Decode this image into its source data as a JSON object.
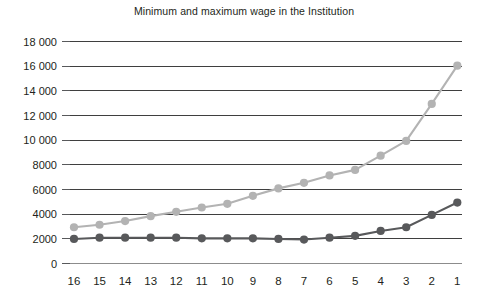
{
  "chart_data": {
    "type": "line",
    "title": "Minimum and maximum wage in the Institution",
    "xlabel": "",
    "ylabel": "",
    "categories": [
      "16",
      "15",
      "14",
      "13",
      "12",
      "11",
      "10",
      "9",
      "8",
      "7",
      "6",
      "5",
      "4",
      "3",
      "2",
      "1"
    ],
    "ylim": [
      0,
      18000
    ],
    "yticks": [
      0,
      2000,
      4000,
      6000,
      8000,
      10000,
      12000,
      14000,
      16000,
      18000
    ],
    "ytick_labels": [
      "0",
      "2000",
      "4000",
      "6000",
      "8000",
      "10 000",
      "12 000",
      "14 000",
      "16 000",
      "18 000"
    ],
    "grid": true,
    "legend": "none",
    "series": [
      {
        "name": "maximum wage",
        "color": "#b3b3b3",
        "marker": "circle",
        "values": [
          2900,
          3100,
          3400,
          3800,
          4150,
          4500,
          4800,
          5450,
          6050,
          6500,
          7100,
          7550,
          8700,
          9900,
          12900,
          16000
        ]
      },
      {
        "name": "minimum wage",
        "color": "#58595b",
        "marker": "circle",
        "values": [
          1950,
          2050,
          2050,
          2050,
          2050,
          2000,
          2000,
          2000,
          1950,
          1900,
          2050,
          2200,
          2600,
          2900,
          3900,
          4900
        ]
      }
    ]
  }
}
